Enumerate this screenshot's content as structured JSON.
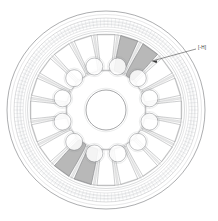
{
  "figure": {
    "kind": "fea-mesh-plan-view",
    "background_color": "#ffffff",
    "line_color": "#8a8c90",
    "dark_line_color": "#5a5c60",
    "highlight_fill": "#b5b5b5",
    "highlight_stroke": "#6e7074",
    "mesh_color": "#9aa0a6"
  },
  "annotation": {
    "label_text": "[-H]",
    "leader": {
      "tip_x": 152,
      "tip_y": 61,
      "elbow_x": 196,
      "elbow_y": 49,
      "arrowhead": "left"
    }
  },
  "geometry": {
    "center_x": 106,
    "center_y": 110,
    "outer_radius": 99,
    "rim_rings": [
      99,
      95.5,
      92,
      88.5,
      85.5,
      83,
      80.5
    ],
    "tick_ring_outer": 92,
    "tick_ring_inner": 83,
    "tick_count": 150,
    "spoke_window_count": 20,
    "spoke_window_outer_r": 76,
    "spoke_window_inner_r": 40,
    "bolt_hole_ring_radius": 45,
    "bolt_hole_count": 12,
    "bolt_hole_radius": 8.5,
    "center_bore_radius": 20,
    "highlight_window_indices": [
      1,
      2,
      11,
      12
    ]
  },
  "chart_data": {
    "type": "scatter",
    "title": "",
    "xlabel": "",
    "ylabel": "",
    "categories": [
      "outer rim mesh band",
      "radial spoke windows",
      "bolt hole ring",
      "center bore",
      "highlighted windows"
    ],
    "values": [
      150,
      20,
      12,
      1,
      4
    ]
  }
}
